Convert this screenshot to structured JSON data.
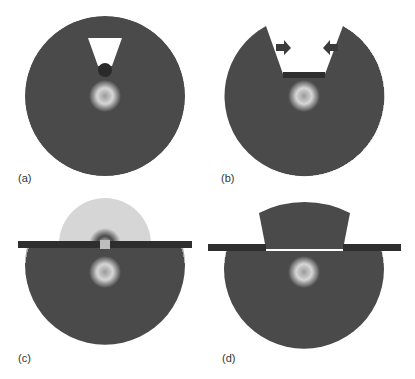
{
  "figure": {
    "panels": [
      {
        "id": "a",
        "label": "(a)",
        "description": "Concentric wave rings with a wedge-shaped gap and a dark point source at the wedge tip"
      },
      {
        "id": "b",
        "label": "(b)",
        "description": "Concentric wave rings with a wide wedge cut out; arrows point inward toward the gap; dark bar at the gap bottom"
      },
      {
        "id": "c",
        "label": "(c)",
        "description": "Horizontal barrier with a small aperture; smaller ring pattern emerges above the barrier"
      },
      {
        "id": "d",
        "label": "(d)",
        "description": "Horizontal barrier with a wide opening; the wave pattern continues through the opening as a truncated cap"
      }
    ],
    "colors": {
      "ring_dark": "#3a3a3a",
      "ring_light": "#d8d8d8",
      "barrier": "#2e2e2e",
      "background": "#ffffff"
    }
  }
}
